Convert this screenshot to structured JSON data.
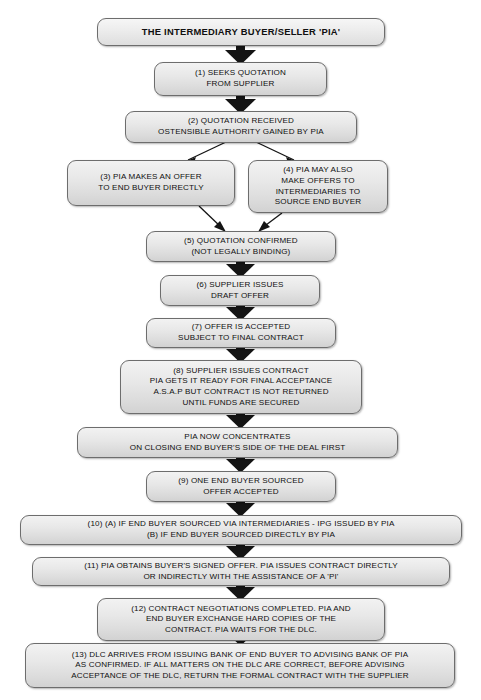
{
  "diagram": {
    "title": "THE INTERMEDIARY BUYER/SELLER 'PIA'",
    "nodes": [
      {
        "id": "title",
        "label": "THE INTERMEDIARY BUYER/SELLER 'PIA'"
      },
      {
        "id": "step1",
        "label": "(1) SEEKS QUOTATION\nFROM SUPPLIER"
      },
      {
        "id": "step2",
        "label": "(2) QUOTATION RECEIVED\nOSTENSIBLE AUTHORITY GAINED BY PIA"
      },
      {
        "id": "step3",
        "label": "(3) PIA MAKES AN OFFER\nTO END BUYER DIRECTLY"
      },
      {
        "id": "step4",
        "label": "(4) PIA MAY ALSO\nMAKE OFFERS TO\nINTERMEDIARIES TO\nSOURCE END BUYER"
      },
      {
        "id": "step5",
        "label": "(5) QUOTATION CONFIRMED\n(NOT LEGALLY BINDING)"
      },
      {
        "id": "step6",
        "label": "(6) SUPPLIER ISSUES\nDRAFT OFFER"
      },
      {
        "id": "step7",
        "label": "(7) OFFER IS ACCEPTED\nSUBJECT TO FINAL CONTRACT"
      },
      {
        "id": "step8",
        "label": "(8) SUPPLIER ISSUES CONTRACT\nPIA GETS IT READY FOR FINAL ACCEPTANCE\nA.S.A.P BUT CONTRACT IS NOT RETURNED\nUNTIL FUNDS ARE SECURED"
      },
      {
        "id": "step8b",
        "label": "PIA NOW CONCENTRATES\nON CLOSING END BUYER'S SIDE OF THE DEAL FIRST"
      },
      {
        "id": "step9",
        "label": "(9) ONE END BUYER SOURCED\nOFFER ACCEPTED"
      },
      {
        "id": "step10",
        "label": "(10)  (A) IF END BUYER SOURCED VIA INTERMEDIARIES - IPG ISSUED BY PIA\n(B) IF END BUYER SOURCED DIRECTLY BY PIA"
      },
      {
        "id": "step11",
        "label": "(11) PIA OBTAINS BUYER'S SIGNED OFFER. PIA ISSUES CONTRACT DIRECTLY\nOR INDIRECTLY WITH THE ASSISTANCE OF A 'PI'"
      },
      {
        "id": "step12",
        "label": "(12) CONTRACT NEGOTIATIONS COMPLETED. PIA AND\nEND BUYER EXCHANGE HARD COPIES OF THE\nCONTRACT. PIA WAITS FOR THE DLC."
      },
      {
        "id": "step13",
        "label": "(13) DLC ARRIVES FROM ISSUING BANK OF END BUYER TO ADVISING BANK OF PIA\nAS CONFIRMED. IF ALL MATTERS ON THE DLC ARE CORRECT, BEFORE ADVISING\nACCEPTANCE OF THE DLC, RETURN THE FORMAL CONTRACT WITH THE SUPPLIER"
      }
    ],
    "colors": {
      "box_fill": "#e6e6e6",
      "box_border": "#6d6d6d",
      "arrow": "#111111",
      "text": "#101010",
      "background": "#ffffff"
    }
  }
}
